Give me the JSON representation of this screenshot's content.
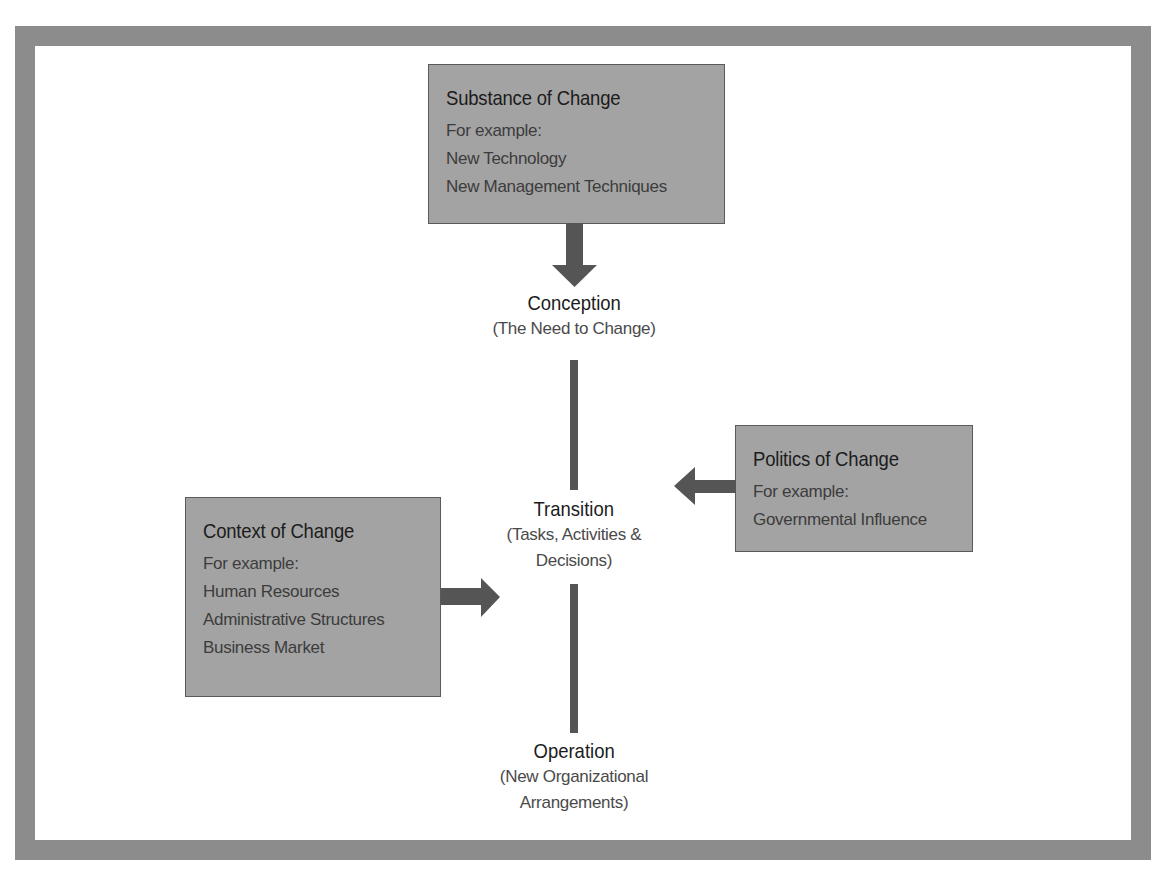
{
  "diagram": {
    "colors": {
      "frame": "#8c8c8c",
      "box_fill": "#a3a3a3",
      "box_border": "#5a5a5a",
      "connector": "#555555",
      "heading_text": "#1c1c1c",
      "body_text": "#3c3c3c"
    },
    "boxes": {
      "substance": {
        "title": "Substance of Change",
        "lines": [
          "For example:",
          "New Technology",
          "New Management Techniques"
        ]
      },
      "politics": {
        "title": "Politics of Change",
        "lines": [
          "For example:",
          "Governmental Influence"
        ]
      },
      "context": {
        "title": "Context of Change",
        "lines": [
          "For example:",
          "Human Resources",
          "Administrative Structures",
          "Business Market"
        ]
      }
    },
    "stages": {
      "conception": {
        "title": "Conception",
        "sub": [
          "(The Need to Change)"
        ]
      },
      "transition": {
        "title": "Transition",
        "sub": [
          "(Tasks, Activities &",
          "Decisions)"
        ]
      },
      "operation": {
        "title": "Operation",
        "sub": [
          "(New Organizational",
          "Arrangements)"
        ]
      }
    },
    "connections": [
      {
        "from": "substance",
        "to": "conception",
        "type": "arrow-down"
      },
      {
        "from": "conception",
        "to": "transition",
        "type": "line"
      },
      {
        "from": "politics",
        "to": "transition",
        "type": "arrow-left"
      },
      {
        "from": "context",
        "to": "transition",
        "type": "arrow-right"
      },
      {
        "from": "transition",
        "to": "operation",
        "type": "line"
      }
    ]
  }
}
